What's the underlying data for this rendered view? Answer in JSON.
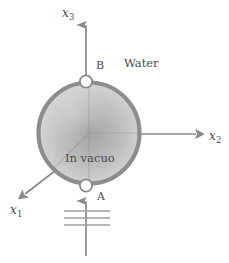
{
  "figure": {
    "background_color": "#ffffff",
    "axes": [
      {
        "id": "x1",
        "base": "x",
        "subscript": "1",
        "label": "x1",
        "direction": "down-left"
      },
      {
        "id": "x2",
        "base": "x",
        "subscript": "2",
        "label": "x2",
        "direction": "right"
      },
      {
        "id": "x3",
        "base": "x",
        "subscript": "3",
        "label": "x3",
        "direction": "up"
      }
    ],
    "nodes": [
      {
        "id": "A",
        "label": "A",
        "position": "bottom-of-sphere"
      },
      {
        "id": "B",
        "label": "B",
        "position": "top-of-sphere"
      }
    ],
    "regions": [
      {
        "id": "outside",
        "label": "Water"
      },
      {
        "id": "inside",
        "label": "In vacuo"
      }
    ],
    "sphere": {
      "center_x": 89,
      "center_y": 133,
      "radius": 52,
      "rim_color": "#8c8c8c",
      "fill_center_color": "#9a9a9a",
      "fill_edge_color": "#cfcfcf"
    },
    "feed_lines": {
      "count": 3,
      "color": "#9d9d9d"
    },
    "line_color": "#8a8a8a"
  }
}
